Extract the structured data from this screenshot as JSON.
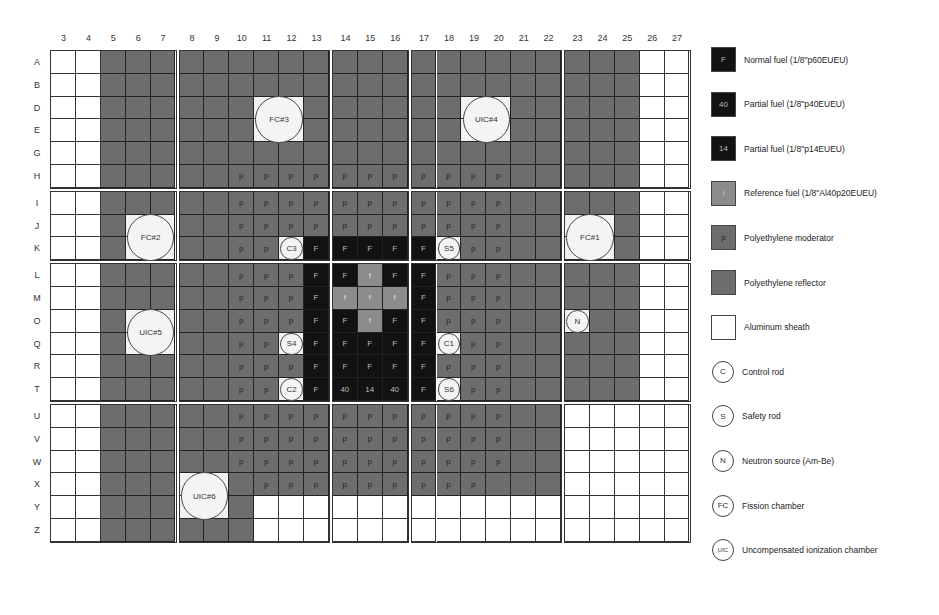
{
  "diagram": {
    "columns": [
      "3",
      "4",
      "5",
      "6",
      "7",
      "8",
      "9",
      "10",
      "11",
      "12",
      "13",
      "14",
      "15",
      "16",
      "17",
      "18",
      "19",
      "20",
      "21",
      "22",
      "23",
      "24",
      "25",
      "26",
      "27"
    ],
    "rows": [
      "A",
      "B",
      "D",
      "E",
      "G",
      "H",
      "I",
      "J",
      "K",
      "L",
      "M",
      "O",
      "Q",
      "R",
      "T",
      "U",
      "V",
      "W",
      "X",
      "Y",
      "Z"
    ],
    "column_blocks": [
      5,
      6,
      3,
      6,
      5
    ],
    "row_blocks": [
      6,
      3,
      6,
      6
    ],
    "cell_key": {
      "w": "Aluminum sheath (empty)",
      "r": "Polyethylene reflector",
      "p": "Polyethylene moderator",
      "F": "Normal fuel",
      "40": "Partial fuel 40",
      "14": "Partial fuel 14",
      "f": "Reference fuel",
      "x": "Instrument position"
    },
    "grid": [
      [
        "w",
        "w",
        "r",
        "r",
        "r",
        "r",
        "r",
        "r",
        "r",
        "r",
        "r",
        "r",
        "r",
        "r",
        "r",
        "r",
        "r",
        "r",
        "r",
        "r",
        "r",
        "r",
        "r",
        "w",
        "w"
      ],
      [
        "w",
        "w",
        "r",
        "r",
        "r",
        "r",
        "r",
        "r",
        "r",
        "r",
        "r",
        "r",
        "r",
        "r",
        "r",
        "r",
        "r",
        "r",
        "r",
        "r",
        "r",
        "r",
        "r",
        "w",
        "w"
      ],
      [
        "w",
        "w",
        "r",
        "r",
        "r",
        "r",
        "r",
        "r",
        "x",
        "x",
        "r",
        "r",
        "r",
        "r",
        "r",
        "r",
        "x",
        "x",
        "r",
        "r",
        "r",
        "r",
        "r",
        "w",
        "w"
      ],
      [
        "w",
        "w",
        "r",
        "r",
        "r",
        "r",
        "r",
        "r",
        "x",
        "x",
        "r",
        "r",
        "r",
        "r",
        "r",
        "r",
        "x",
        "x",
        "r",
        "r",
        "r",
        "r",
        "r",
        "w",
        "w"
      ],
      [
        "w",
        "w",
        "r",
        "r",
        "r",
        "r",
        "r",
        "r",
        "r",
        "r",
        "r",
        "r",
        "r",
        "r",
        "r",
        "r",
        "r",
        "r",
        "r",
        "r",
        "r",
        "r",
        "r",
        "w",
        "w"
      ],
      [
        "w",
        "w",
        "r",
        "r",
        "r",
        "r",
        "r",
        "p",
        "p",
        "p",
        "p",
        "p",
        "p",
        "p",
        "p",
        "p",
        "p",
        "p",
        "r",
        "r",
        "r",
        "r",
        "r",
        "w",
        "w"
      ],
      [
        "w",
        "w",
        "r",
        "r",
        "r",
        "r",
        "r",
        "p",
        "p",
        "p",
        "p",
        "p",
        "p",
        "p",
        "p",
        "p",
        "p",
        "p",
        "r",
        "r",
        "r",
        "r",
        "r",
        "w",
        "w"
      ],
      [
        "w",
        "w",
        "r",
        "x",
        "x",
        "r",
        "r",
        "p",
        "p",
        "p",
        "p",
        "p",
        "p",
        "p",
        "p",
        "p",
        "p",
        "p",
        "r",
        "r",
        "x",
        "x",
        "r",
        "w",
        "w"
      ],
      [
        "w",
        "w",
        "r",
        "x",
        "x",
        "r",
        "r",
        "p",
        "p",
        "x",
        "F",
        "F",
        "F",
        "F",
        "F",
        "x",
        "p",
        "p",
        "r",
        "r",
        "x",
        "x",
        "r",
        "w",
        "w"
      ],
      [
        "w",
        "w",
        "r",
        "r",
        "r",
        "r",
        "r",
        "p",
        "p",
        "p",
        "F",
        "F",
        "f",
        "F",
        "F",
        "p",
        "p",
        "p",
        "r",
        "r",
        "r",
        "r",
        "r",
        "w",
        "w"
      ],
      [
        "w",
        "w",
        "r",
        "r",
        "r",
        "r",
        "r",
        "p",
        "p",
        "p",
        "F",
        "f",
        "f",
        "f",
        "F",
        "p",
        "p",
        "p",
        "r",
        "r",
        "r",
        "r",
        "r",
        "w",
        "w"
      ],
      [
        "w",
        "w",
        "r",
        "x",
        "x",
        "r",
        "r",
        "p",
        "p",
        "p",
        "F",
        "F",
        "f",
        "F",
        "F",
        "p",
        "p",
        "p",
        "r",
        "r",
        "x",
        "r",
        "r",
        "w",
        "w"
      ],
      [
        "w",
        "w",
        "r",
        "x",
        "x",
        "r",
        "r",
        "p",
        "p",
        "x",
        "F",
        "F",
        "F",
        "F",
        "F",
        "x",
        "p",
        "p",
        "r",
        "r",
        "r",
        "r",
        "r",
        "w",
        "w"
      ],
      [
        "w",
        "w",
        "r",
        "r",
        "r",
        "r",
        "r",
        "p",
        "p",
        "p",
        "F",
        "F",
        "F",
        "F",
        "F",
        "p",
        "p",
        "p",
        "r",
        "r",
        "r",
        "r",
        "r",
        "w",
        "w"
      ],
      [
        "w",
        "w",
        "r",
        "r",
        "r",
        "r",
        "r",
        "p",
        "p",
        "x",
        "F",
        "40",
        "14",
        "40",
        "F",
        "x",
        "p",
        "p",
        "r",
        "r",
        "r",
        "r",
        "r",
        "w",
        "w"
      ],
      [
        "w",
        "w",
        "r",
        "r",
        "r",
        "r",
        "r",
        "p",
        "p",
        "p",
        "p",
        "p",
        "p",
        "p",
        "p",
        "p",
        "p",
        "p",
        "r",
        "r",
        "w",
        "w",
        "w",
        "w",
        "w"
      ],
      [
        "w",
        "w",
        "r",
        "r",
        "r",
        "r",
        "r",
        "p",
        "p",
        "p",
        "p",
        "p",
        "p",
        "p",
        "p",
        "p",
        "p",
        "p",
        "r",
        "r",
        "w",
        "w",
        "w",
        "w",
        "w"
      ],
      [
        "w",
        "w",
        "r",
        "r",
        "r",
        "r",
        "r",
        "p",
        "p",
        "p",
        "p",
        "p",
        "p",
        "p",
        "p",
        "p",
        "p",
        "p",
        "r",
        "r",
        "w",
        "w",
        "w",
        "w",
        "w"
      ],
      [
        "w",
        "w",
        "r",
        "r",
        "r",
        "x",
        "x",
        "r",
        "p",
        "p",
        "p",
        "p",
        "p",
        "p",
        "p",
        "p",
        "p",
        "r",
        "r",
        "r",
        "w",
        "w",
        "w",
        "w",
        "w"
      ],
      [
        "w",
        "w",
        "r",
        "r",
        "r",
        "x",
        "x",
        "r",
        "w",
        "w",
        "w",
        "w",
        "w",
        "w",
        "w",
        "w",
        "w",
        "w",
        "w",
        "w",
        "w",
        "w",
        "w",
        "w",
        "w"
      ],
      [
        "w",
        "w",
        "r",
        "r",
        "r",
        "r",
        "r",
        "r",
        "w",
        "w",
        "w",
        "w",
        "w",
        "w",
        "w",
        "w",
        "w",
        "w",
        "w",
        "w",
        "w",
        "w",
        "w",
        "w",
        "w"
      ]
    ],
    "instruments": [
      {
        "label": "FC#3",
        "type": "fission-chamber",
        "col": 8,
        "row": 2,
        "size": 2
      },
      {
        "label": "UIC#4",
        "type": "uic",
        "col": 16,
        "row": 2,
        "size": 2
      },
      {
        "label": "FC#2",
        "type": "fission-chamber",
        "col": 3,
        "row": 7,
        "size": 2
      },
      {
        "label": "FC#1",
        "type": "fission-chamber",
        "col": 20,
        "row": 7,
        "size": 2
      },
      {
        "label": "UIC#5",
        "type": "uic",
        "col": 3,
        "row": 11,
        "size": 2
      },
      {
        "label": "UIC#6",
        "type": "uic",
        "col": 5,
        "row": 18,
        "size": 2
      },
      {
        "label": "C3",
        "type": "control-rod",
        "col": 9,
        "row": 8,
        "size": 1
      },
      {
        "label": "S5",
        "type": "safety-rod",
        "col": 15,
        "row": 8,
        "size": 1
      },
      {
        "label": "S4",
        "type": "safety-rod",
        "col": 9,
        "row": 12,
        "size": 1
      },
      {
        "label": "C1",
        "type": "control-rod",
        "col": 15,
        "row": 12,
        "size": 1
      },
      {
        "label": "C2",
        "type": "control-rod",
        "col": 9,
        "row": 14,
        "size": 1
      },
      {
        "label": "S6",
        "type": "safety-rod",
        "col": 15,
        "row": 14,
        "size": 1
      },
      {
        "label": "N",
        "type": "neutron-source",
        "col": 20,
        "row": 11,
        "size": 1
      }
    ]
  },
  "legend": [
    {
      "kind": "square",
      "symbol": "F",
      "color": "#121212",
      "label": "Normal fuel (1/8\"p60EUEU)"
    },
    {
      "kind": "square",
      "symbol": "40",
      "color": "#121212",
      "label": "Partial fuel (1/8\"p40EUEU)"
    },
    {
      "kind": "square",
      "symbol": "14",
      "color": "#121212",
      "label": "Partial fuel (1/8\"p14EUEU)"
    },
    {
      "kind": "square",
      "symbol": "f",
      "color": "#8c8c8c",
      "label": "Reference fuel (1/8\"Al40p20EUEU)"
    },
    {
      "kind": "square",
      "symbol": "p",
      "color": "#6d6d6d",
      "label": "Polyethylene moderator"
    },
    {
      "kind": "square",
      "symbol": "",
      "color": "#6d6d6d",
      "label": "Polyethylene reflector"
    },
    {
      "kind": "square",
      "symbol": "",
      "color": "#ffffff",
      "label": "Aluminum sheath"
    },
    {
      "kind": "circle",
      "symbol": "C",
      "color": "#ffffff",
      "label": "Control rod"
    },
    {
      "kind": "circle",
      "symbol": "S",
      "color": "#ffffff",
      "label": "Safety rod"
    },
    {
      "kind": "circle",
      "symbol": "N",
      "color": "#ffffff",
      "label": "Neutron source (Am-Be)"
    },
    {
      "kind": "circle",
      "symbol": "FC",
      "color": "#ffffff",
      "label": "Fission chamber"
    },
    {
      "kind": "circle",
      "symbol": "UIC",
      "color": "#ffffff",
      "label": "Uncompensated ionization chamber"
    }
  ]
}
